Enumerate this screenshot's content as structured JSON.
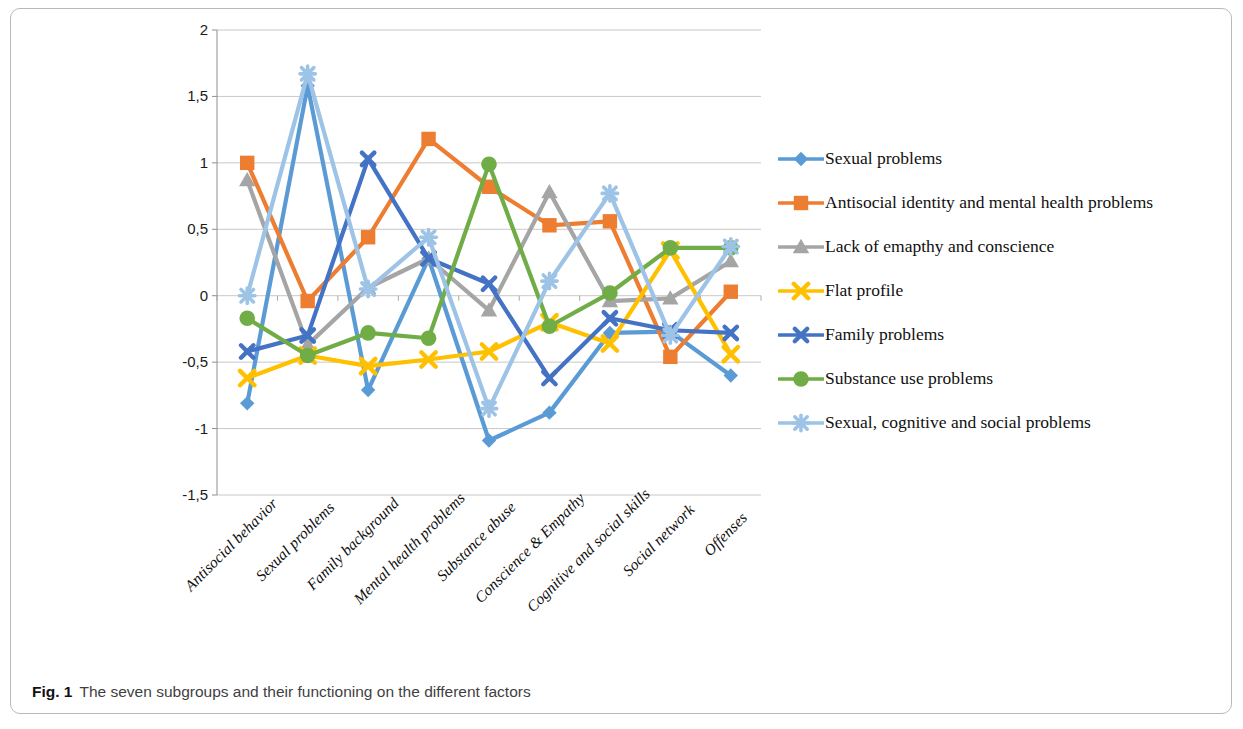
{
  "caption": {
    "label": "Fig. 1",
    "text": "The seven subgroups and their functioning on the different factors"
  },
  "chart_data": {
    "type": "line",
    "title": "",
    "xlabel": "",
    "ylabel": "",
    "ylim": [
      -1.5,
      2
    ],
    "ytick_labels": [
      "2",
      "1,5",
      "1",
      "0,5",
      "0",
      "-0,5",
      "-1",
      "-1,5"
    ],
    "ytick_values": [
      2,
      1.5,
      1,
      0.5,
      0,
      -0.5,
      -1,
      -1.5
    ],
    "grid": true,
    "legend_position": "right",
    "categories": [
      "Antisocial behavior",
      "Sexual problems",
      "Family background",
      "Mental health problems",
      "Substance abuse",
      "Conscience & Empathy",
      "Cognitive and social skills",
      "Social network",
      "Offenses"
    ],
    "series": [
      {
        "name": "Sexual problems",
        "color": "#5B9BD5",
        "marker": "diamond",
        "values": [
          -0.81,
          1.58,
          -0.71,
          0.28,
          -1.09,
          -0.88,
          -0.28,
          -0.27,
          -0.6
        ]
      },
      {
        "name": "Antisocial identity and mental health problems",
        "color": "#ED7D31",
        "marker": "square",
        "values": [
          1.0,
          -0.04,
          0.44,
          1.18,
          0.82,
          0.53,
          0.56,
          -0.46,
          0.03
        ]
      },
      {
        "name": "Lack of emapthy and conscience",
        "color": "#A5A5A5",
        "marker": "triangle",
        "values": [
          0.87,
          -0.37,
          0.06,
          0.28,
          -0.11,
          0.78,
          -0.04,
          -0.02,
          0.26
        ]
      },
      {
        "name": "Flat profile",
        "color": "#FFC000",
        "marker": "cross",
        "values": [
          -0.62,
          -0.45,
          -0.53,
          -0.48,
          -0.42,
          -0.2,
          -0.36,
          0.34,
          -0.44
        ]
      },
      {
        "name": "Family problems",
        "color": "#4472C4",
        "marker": "cross-square",
        "values": [
          -0.42,
          -0.3,
          1.03,
          0.28,
          0.09,
          -0.62,
          -0.17,
          -0.26,
          -0.28
        ]
      },
      {
        "name": "Substance use problems",
        "color": "#70AD47",
        "marker": "circle",
        "values": [
          -0.17,
          -0.45,
          -0.28,
          -0.32,
          0.99,
          -0.23,
          0.02,
          0.36,
          0.36
        ]
      },
      {
        "name": "Sexual, cognitive and social problems",
        "color": "#9DC3E6",
        "marker": "star",
        "values": [
          0.0,
          1.67,
          0.05,
          0.44,
          -0.85,
          0.11,
          0.77,
          -0.3,
          0.37
        ]
      }
    ]
  }
}
